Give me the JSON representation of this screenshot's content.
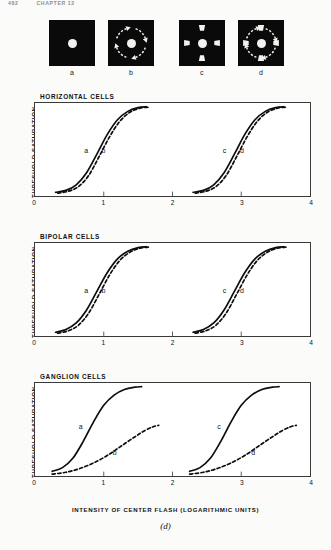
{
  "page_header": {
    "page_number": "482",
    "running_head": "CHAPTER 12"
  },
  "stimuli": [
    {
      "id": "stimulus-a",
      "label": "a",
      "description": "center-spot-only",
      "has_center_spot": true,
      "has_surround_elements": false,
      "has_rotating_arrows": true
    },
    {
      "id": "stimulus-b",
      "label": "b",
      "description": "center-spot-with-rotating-surround-arrows",
      "has_center_spot": true,
      "has_surround_elements": false,
      "has_rotating_arrows": true
    },
    {
      "id": "stimulus-c",
      "label": "c",
      "description": "center-spot-with-four-static-surround-patches",
      "has_center_spot": true,
      "has_surround_elements": true,
      "has_rotating_arrows": false
    },
    {
      "id": "stimulus-d",
      "label": "d",
      "description": "center-spot-with-four-surround-patches-and-rotating-arrows",
      "has_center_spot": true,
      "has_surround_elements": true,
      "has_rotating_arrows": true
    }
  ],
  "chart_data": {
    "type": "line",
    "title": "",
    "xlabel": "INTENSITY OF CENTER FLASH (LOGARITHMIC UNITS)",
    "ylabel": "",
    "y_axis_top_label": "SATURATION",
    "y_axis_bottom_label": "THRESHOLD",
    "xlim": [
      0,
      4
    ],
    "ylim": [
      0,
      1
    ],
    "xticks": [
      "0",
      "1",
      "2",
      "3",
      "4"
    ],
    "xtick_values": [
      0,
      1,
      2,
      3,
      4
    ],
    "grid": false,
    "legend": "inline-curve-labels",
    "figure_caption": "(d)",
    "panels": [
      {
        "name": "HORIZONTAL CELLS",
        "series": [
          {
            "name": "a",
            "style": "solid",
            "label_x": 0.74,
            "label_y": 0.5,
            "x": [
              0.3,
              0.45,
              0.6,
              0.75,
              0.9,
              1.05,
              1.2,
              1.35,
              1.5,
              1.62
            ],
            "y": [
              0.04,
              0.06,
              0.12,
              0.25,
              0.45,
              0.66,
              0.82,
              0.91,
              0.95,
              0.96
            ]
          },
          {
            "name": "b",
            "style": "dashed",
            "label_x": 0.99,
            "label_y": 0.5,
            "x": [
              0.33,
              0.48,
              0.63,
              0.78,
              0.93,
              1.08,
              1.23,
              1.38,
              1.53,
              1.65
            ],
            "y": [
              0.03,
              0.05,
              0.1,
              0.22,
              0.42,
              0.63,
              0.8,
              0.9,
              0.945,
              0.955
            ]
          },
          {
            "name": "c",
            "style": "solid",
            "label_x": 2.74,
            "label_y": 0.5,
            "x": [
              2.3,
              2.45,
              2.6,
              2.75,
              2.9,
              3.05,
              3.2,
              3.35,
              3.5,
              3.62
            ],
            "y": [
              0.04,
              0.06,
              0.12,
              0.25,
              0.45,
              0.66,
              0.82,
              0.91,
              0.95,
              0.96
            ]
          },
          {
            "name": "d",
            "style": "dashed",
            "label_x": 2.99,
            "label_y": 0.5,
            "x": [
              2.33,
              2.48,
              2.63,
              2.78,
              2.93,
              3.08,
              3.23,
              3.38,
              3.53,
              3.65
            ],
            "y": [
              0.03,
              0.05,
              0.1,
              0.22,
              0.42,
              0.63,
              0.8,
              0.9,
              0.945,
              0.955
            ]
          }
        ]
      },
      {
        "name": "BIPOLAR CELLS",
        "series": [
          {
            "name": "a",
            "style": "solid",
            "label_x": 0.74,
            "label_y": 0.5,
            "x": [
              0.3,
              0.45,
              0.6,
              0.75,
              0.9,
              1.05,
              1.2,
              1.35,
              1.5,
              1.62
            ],
            "y": [
              0.04,
              0.07,
              0.14,
              0.28,
              0.48,
              0.68,
              0.83,
              0.91,
              0.95,
              0.96
            ]
          },
          {
            "name": "b",
            "style": "dashed",
            "label_x": 0.99,
            "label_y": 0.5,
            "x": [
              0.33,
              0.48,
              0.63,
              0.78,
              0.93,
              1.08,
              1.23,
              1.38,
              1.53,
              1.65
            ],
            "y": [
              0.03,
              0.055,
              0.115,
              0.245,
              0.445,
              0.65,
              0.81,
              0.9,
              0.945,
              0.955
            ]
          },
          {
            "name": "c",
            "style": "solid",
            "label_x": 2.74,
            "label_y": 0.5,
            "x": [
              2.3,
              2.45,
              2.6,
              2.75,
              2.9,
              3.05,
              3.2,
              3.35,
              3.5,
              3.62
            ],
            "y": [
              0.04,
              0.07,
              0.14,
              0.28,
              0.48,
              0.68,
              0.83,
              0.91,
              0.95,
              0.96
            ]
          },
          {
            "name": "d",
            "style": "dashed",
            "label_x": 2.99,
            "label_y": 0.5,
            "x": [
              2.33,
              2.48,
              2.63,
              2.78,
              2.93,
              3.08,
              3.23,
              3.38,
              3.53,
              3.65
            ],
            "y": [
              0.03,
              0.055,
              0.115,
              0.245,
              0.445,
              0.65,
              0.81,
              0.9,
              0.945,
              0.955
            ]
          }
        ]
      },
      {
        "name": "GANGLION CELLS",
        "series": [
          {
            "name": "a",
            "style": "solid",
            "label_x": 0.66,
            "label_y": 0.54,
            "x": [
              0.25,
              0.4,
              0.55,
              0.7,
              0.85,
              1.0,
              1.15,
              1.3,
              1.45,
              1.55
            ],
            "y": [
              0.05,
              0.09,
              0.19,
              0.37,
              0.58,
              0.76,
              0.87,
              0.93,
              0.955,
              0.96
            ]
          },
          {
            "name": "b",
            "style": "dashed",
            "label_x": 1.15,
            "label_y": 0.26,
            "x": [
              0.25,
              0.45,
              0.65,
              0.85,
              1.05,
              1.25,
              1.45,
              1.6,
              1.72,
              1.8
            ],
            "y": [
              0.02,
              0.04,
              0.08,
              0.14,
              0.22,
              0.32,
              0.42,
              0.49,
              0.53,
              0.545
            ]
          },
          {
            "name": "c",
            "style": "solid",
            "label_x": 2.66,
            "label_y": 0.54,
            "x": [
              2.25,
              2.4,
              2.55,
              2.7,
              2.85,
              3.0,
              3.15,
              3.3,
              3.45,
              3.55
            ],
            "y": [
              0.05,
              0.09,
              0.19,
              0.37,
              0.58,
              0.76,
              0.87,
              0.93,
              0.955,
              0.96
            ]
          },
          {
            "name": "d",
            "style": "dashed",
            "label_x": 3.15,
            "label_y": 0.26,
            "x": [
              2.25,
              2.45,
              2.65,
              2.85,
              3.05,
              3.25,
              3.45,
              3.6,
              3.72,
              3.8
            ],
            "y": [
              0.02,
              0.04,
              0.08,
              0.14,
              0.22,
              0.32,
              0.42,
              0.49,
              0.53,
              0.545
            ]
          }
        ]
      }
    ]
  }
}
